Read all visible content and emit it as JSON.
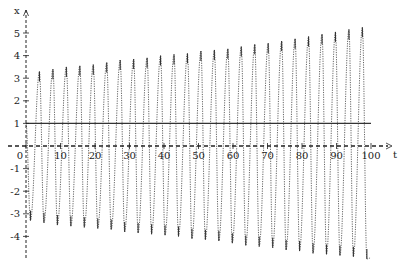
{
  "chart_data": {
    "type": "line",
    "title": "",
    "xlabel": "t",
    "ylabel": "x",
    "xlim": [
      0,
      100
    ],
    "ylim": [
      -4.5,
      5.7
    ],
    "grid": false,
    "legend": null,
    "x_ticks": [
      0,
      10,
      20,
      30,
      40,
      50,
      60,
      70,
      80,
      90,
      100
    ],
    "x_tick_labels": [
      "0",
      "10",
      "20",
      "30",
      "40",
      "50",
      "60",
      "70",
      "80",
      "90",
      "100"
    ],
    "y_ticks": [
      -4,
      -3,
      -2,
      -1,
      1,
      2,
      3,
      4,
      5
    ],
    "y_tick_labels": [
      "-4",
      "-3",
      "-2",
      "-1",
      "1",
      "2",
      "3",
      "4",
      "5"
    ],
    "series": [
      {
        "name": "x(t)",
        "kind": "oscillation",
        "style": "dotted",
        "description": "Oscillation with linearly growing amplitude, period about 3.9",
        "period": 3.9,
        "phase_t_first_trough": 1.3,
        "amplitude_start": 3.3,
        "amplitude_end": 5.1,
        "offset": 0.0,
        "peaks": [
          {
            "t": 3.9,
            "x": 3.3
          },
          {
            "t": 7.8,
            "x": 3.4
          },
          {
            "t": 11.7,
            "x": 3.5
          },
          {
            "t": 15.6,
            "x": 3.55
          },
          {
            "t": 19.5,
            "x": 3.6
          },
          {
            "t": 23.4,
            "x": 3.7
          },
          {
            "t": 27.3,
            "x": 3.8
          },
          {
            "t": 31.2,
            "x": 3.85
          },
          {
            "t": 35.1,
            "x": 3.9
          },
          {
            "t": 39.0,
            "x": 4.0
          },
          {
            "t": 42.9,
            "x": 4.05
          },
          {
            "t": 46.8,
            "x": 4.1
          },
          {
            "t": 50.7,
            "x": 4.2
          },
          {
            "t": 54.6,
            "x": 4.25
          },
          {
            "t": 58.5,
            "x": 4.3
          },
          {
            "t": 62.4,
            "x": 4.4
          },
          {
            "t": 66.3,
            "x": 4.5
          },
          {
            "t": 70.2,
            "x": 4.55
          },
          {
            "t": 74.1,
            "x": 4.65
          },
          {
            "t": 78.0,
            "x": 4.75
          },
          {
            "t": 81.9,
            "x": 4.85
          },
          {
            "t": 85.8,
            "x": 4.95
          },
          {
            "t": 89.7,
            "x": 5.05
          },
          {
            "t": 93.6,
            "x": 5.15
          },
          {
            "t": 97.5,
            "x": 5.25
          }
        ],
        "troughs": [
          {
            "t": 1.3,
            "x": -3.3
          },
          {
            "t": 5.2,
            "x": -3.4
          },
          {
            "t": 9.1,
            "x": -3.5
          },
          {
            "t": 13.0,
            "x": -3.55
          },
          {
            "t": 16.9,
            "x": -3.6
          },
          {
            "t": 20.8,
            "x": -3.65
          },
          {
            "t": 24.7,
            "x": -3.7
          },
          {
            "t": 28.6,
            "x": -3.8
          },
          {
            "t": 32.5,
            "x": -3.85
          },
          {
            "t": 36.4,
            "x": -3.9
          },
          {
            "t": 40.3,
            "x": -3.95
          },
          {
            "t": 44.2,
            "x": -4.0
          },
          {
            "t": 48.1,
            "x": -4.1
          },
          {
            "t": 52.0,
            "x": -4.15
          },
          {
            "t": 55.9,
            "x": -4.2
          },
          {
            "t": 59.8,
            "x": -4.3
          },
          {
            "t": 63.7,
            "x": -4.4
          },
          {
            "t": 67.6,
            "x": -4.45
          },
          {
            "t": 71.5,
            "x": -4.5
          },
          {
            "t": 75.4,
            "x": -4.6
          },
          {
            "t": 79.3,
            "x": -4.65
          },
          {
            "t": 83.2,
            "x": -4.75
          },
          {
            "t": 87.1,
            "x": -4.8
          },
          {
            "t": 91.0,
            "x": -4.85
          },
          {
            "t": 94.9,
            "x": -4.9
          },
          {
            "t": 98.8,
            "x": -5.0
          }
        ]
      },
      {
        "name": "reference line x = 1",
        "kind": "hline",
        "style": "solid",
        "y": 1,
        "t_range": [
          0,
          100
        ]
      }
    ]
  },
  "axes": {
    "x_name": "t",
    "y_name": "x",
    "origin_label": "0"
  },
  "colors": {
    "curve": "#555555",
    "axis": "#222222",
    "hline": "#333333",
    "background": "#ffffff"
  }
}
